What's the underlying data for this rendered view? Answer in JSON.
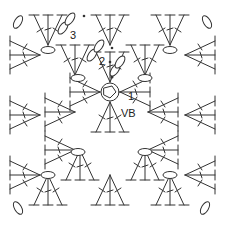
{
  "diagram": {
    "type": "crochet-granny-square-chart",
    "labels": {
      "round1": "1",
      "round2": "2",
      "round3": "3",
      "center": "VB"
    },
    "colors": {
      "ink": "#333333",
      "background": "#ffffff"
    }
  }
}
